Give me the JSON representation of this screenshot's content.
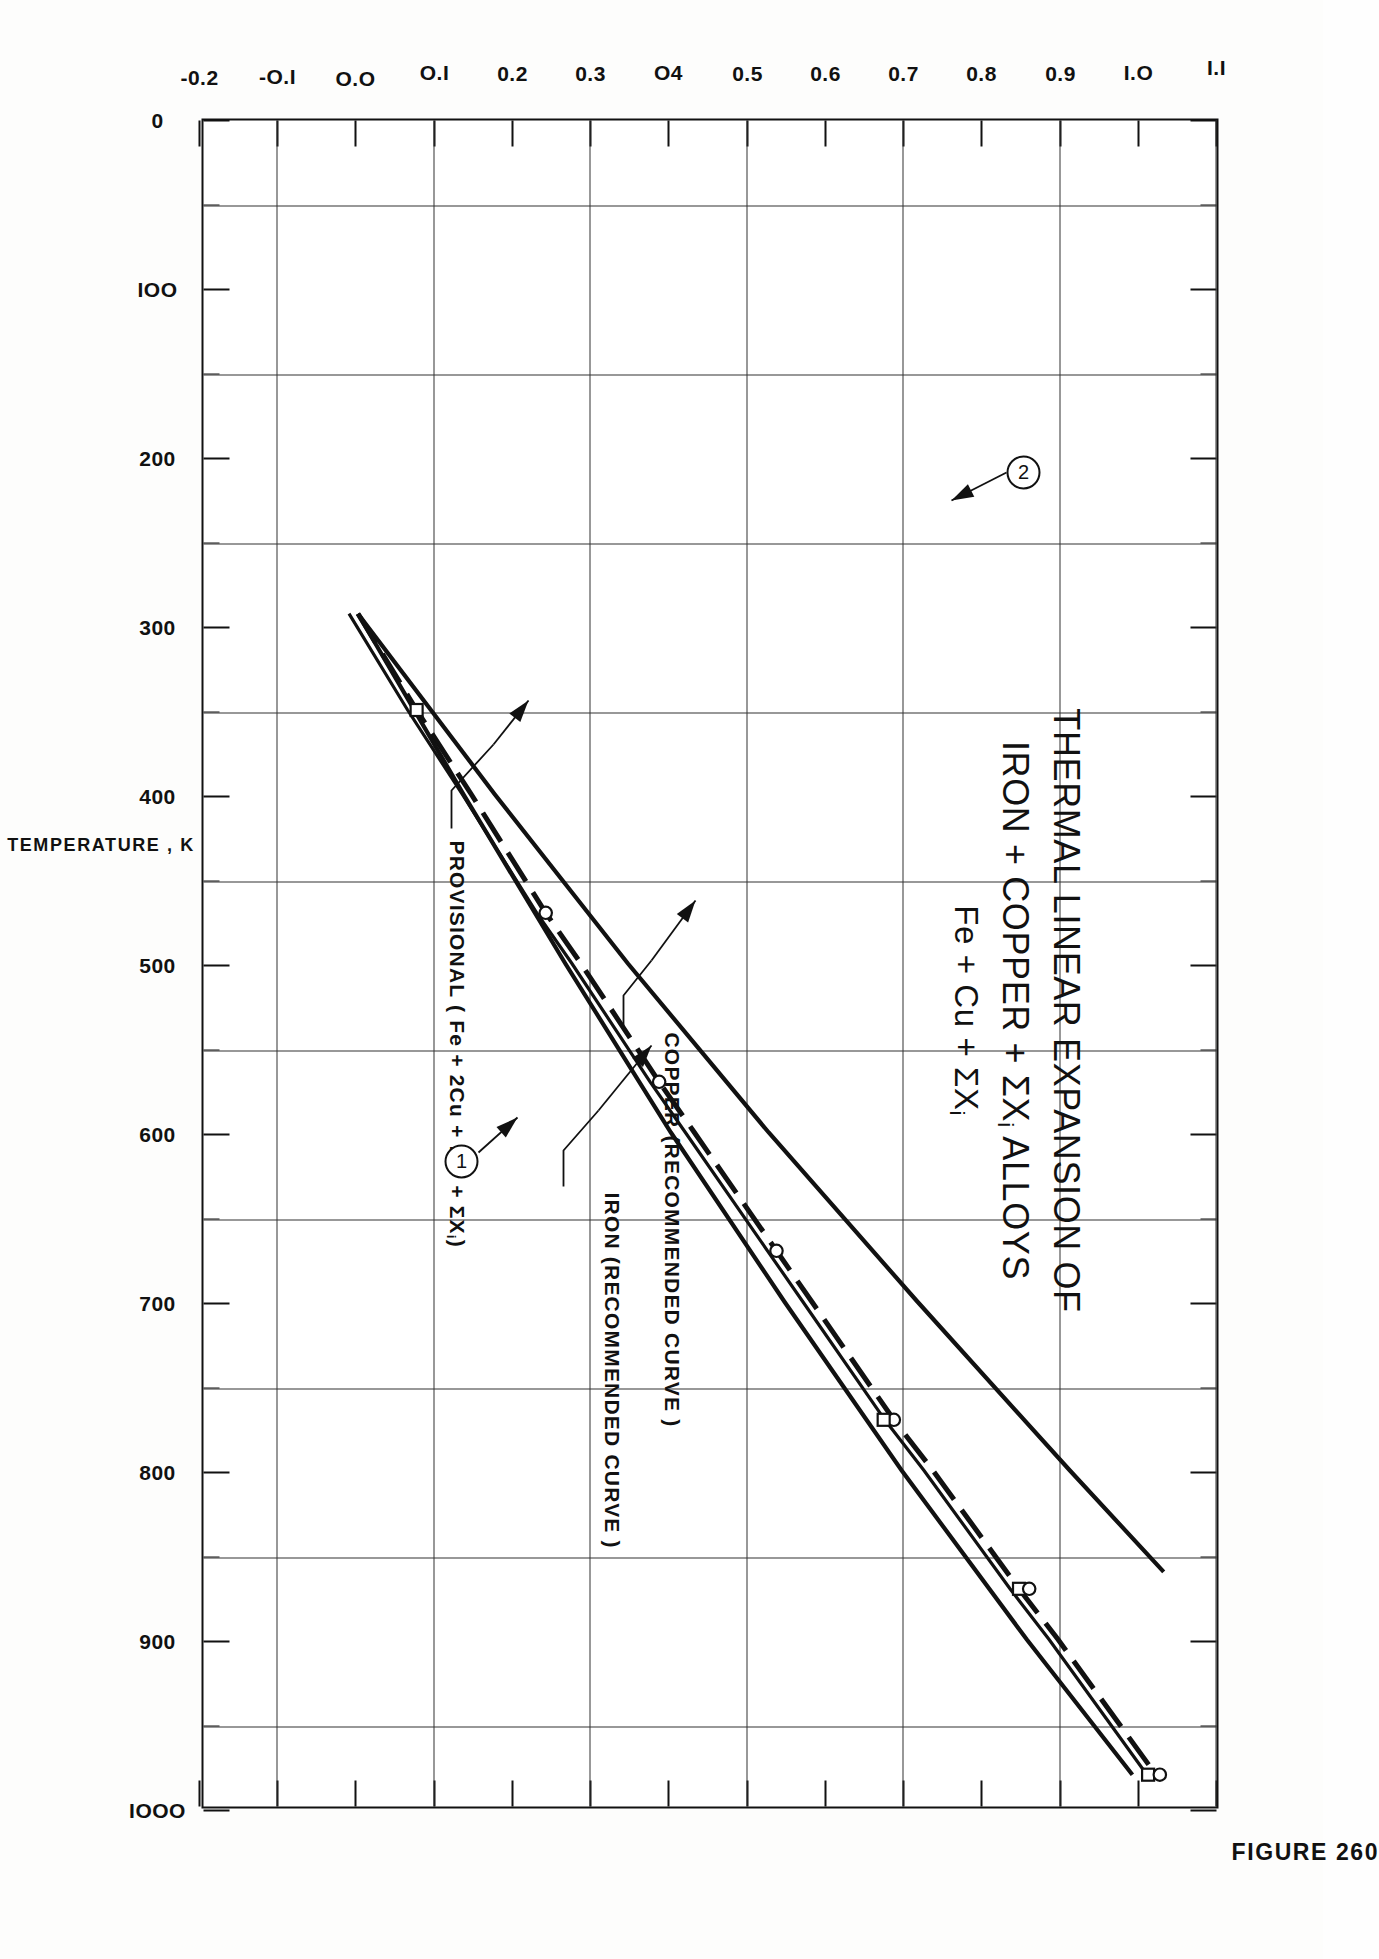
{
  "figure": {
    "number_label": "FIGURE 260",
    "title_line1": "THERMAL LINEAR EXPANSION OF",
    "title_line2_a": "IRON + COPPER + ",
    "title_line2_sigma": "ΣX",
    "title_line2_sub": "i",
    "title_line2_b": " ALLOYS",
    "title_line3_a": "Fe + Cu + ",
    "title_line3_sigma": "ΣX",
    "title_line3_sub": "i"
  },
  "annotations": {
    "provisional": "PROVISIONAL  ( Fe + 2Cu + lCr + ΣX",
    "provisional_sub": "i",
    "provisional_tail": ")",
    "copper": "COPPER  (RECOMMENDED CURVE )",
    "iron": "IRON  (RECOMMENDED CURVE )",
    "callout_1": "1",
    "callout_2": "2"
  },
  "chart_data": {
    "type": "line",
    "title": "THERMAL LINEAR EXPANSION OF IRON + COPPER + ΣXi ALLOYS",
    "xlabel": "TEMPERATURE , K",
    "ylabel": "THERMAL LINEAR EXPANSION , %",
    "xlim": [
      0,
      1000
    ],
    "ylim": [
      -0.2,
      1.1
    ],
    "grid": true,
    "legend_position": "in-plot annotations",
    "xticks": [
      0,
      50,
      100,
      150,
      200,
      250,
      300,
      350,
      400,
      450,
      500,
      550,
      600,
      650,
      700,
      750,
      800,
      850,
      900,
      950,
      1000
    ],
    "xticklabels": [
      "0",
      "50",
      "IOO",
      "I5O",
      "200",
      "250",
      "300",
      "350",
      "400",
      "450",
      "500",
      "550",
      "600",
      "650",
      "700",
      "750",
      "800",
      "850",
      "900",
      "950",
      "IOOO"
    ],
    "yticks": [
      -0.2,
      -0.1,
      0.0,
      0.1,
      0.2,
      0.3,
      0.4,
      0.5,
      0.6,
      0.7,
      0.8,
      0.9,
      1.0,
      1.1
    ],
    "yticklabels": [
      "-0.2",
      "-O.I",
      "O.O",
      "O.I",
      "0.2",
      "0.3",
      "O4",
      "0.5",
      "0.6",
      "0.7",
      "0.8",
      "0.9",
      "I.O",
      "I.I"
    ],
    "gridlines_x": [
      50,
      150,
      250,
      350,
      450,
      550,
      650,
      750,
      850,
      950
    ],
    "gridlines_y": [
      -0.1,
      0.1,
      0.3,
      0.5,
      0.7,
      0.9,
      1.1
    ],
    "series": [
      {
        "name": "PROVISIONAL ( Fe + 2Cu + lCr + ΣXi )",
        "style": "dashed",
        "curve_number": "2",
        "x": [
          293,
          350,
          400,
          470,
          500,
          570,
          600,
          670,
          700,
          770,
          800,
          870,
          900,
          980
        ],
        "y": [
          0.0,
          0.075,
          0.145,
          0.24,
          0.285,
          0.385,
          0.43,
          0.535,
          0.58,
          0.685,
          0.735,
          0.845,
          0.895,
          1.02
        ]
      },
      {
        "name": "COPPER (RECOMMENDED CURVE)",
        "style": "solid",
        "x": [
          293,
          400,
          500,
          600,
          700,
          800,
          860
        ],
        "y": [
          0.0,
          0.175,
          0.345,
          0.525,
          0.715,
          0.91,
          1.03
        ]
      },
      {
        "name": "IRON (RECOMMENDED CURVE)",
        "style": "solid",
        "curve_number": "1",
        "x": [
          293,
          400,
          500,
          600,
          700,
          800,
          900,
          980
        ],
        "y": [
          0.0,
          0.135,
          0.265,
          0.4,
          0.545,
          0.695,
          0.855,
          0.99
        ]
      }
    ],
    "markers": [
      {
        "symbol": "square",
        "x": 350,
        "y": 0.075
      },
      {
        "symbol": "circle",
        "x": 470,
        "y": 0.24
      },
      {
        "symbol": "circle",
        "x": 570,
        "y": 0.385
      },
      {
        "symbol": "circle",
        "x": 670,
        "y": 0.535
      },
      {
        "symbol": "circle",
        "x": 770,
        "y": 0.685
      },
      {
        "symbol": "square",
        "x": 770,
        "y": 0.672
      },
      {
        "symbol": "square",
        "x": 870,
        "y": 0.845
      },
      {
        "symbol": "circle",
        "x": 870,
        "y": 0.858
      },
      {
        "symbol": "square",
        "x": 980,
        "y": 1.01
      },
      {
        "symbol": "circle",
        "x": 980,
        "y": 1.025
      }
    ]
  }
}
